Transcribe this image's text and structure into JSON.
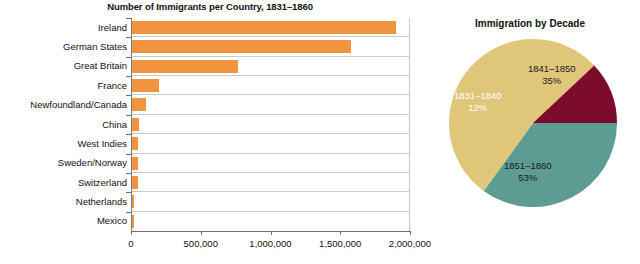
{
  "bar_chart": {
    "title": "Number of Immigrants per Country, 1831–1860",
    "x_ticks": [
      "0",
      "500,000",
      "1,000,000",
      "1,500,000",
      "2,000,000"
    ]
  },
  "pie_chart": {
    "title": "Immigration by Decade"
  },
  "colors": {
    "bar": "#F2943F",
    "pie_teal": "#5C9C92",
    "pie_crimson": "#7D0B2B",
    "pie_gold": "#E0C678",
    "grid": "#C9C9C9",
    "axis": "#6D6D6D",
    "text": "#111111"
  },
  "chart_data": [
    {
      "type": "bar",
      "title": "Number of Immigrants per Country, 1831–1860",
      "xlabel": "",
      "ylabel": "",
      "orientation": "horizontal",
      "grid": true,
      "xlim": [
        0,
        2000000
      ],
      "xticks": [
        0,
        500000,
        1000000,
        1500000,
        2000000
      ],
      "xtick_labels": [
        "0",
        "500,000",
        "1,000,000",
        "1,500,000",
        "2,000,000"
      ],
      "categories": [
        "Ireland",
        "German States",
        "Great Britain",
        "France",
        "Newfoundland/Canada",
        "China",
        "West Indies",
        "Sweden/Norway",
        "Switzerland",
        "Netherlands",
        "Mexico"
      ],
      "values": [
        1890000,
        1570000,
        760000,
        195000,
        100000,
        48000,
        40000,
        42000,
        40000,
        16000,
        6000
      ],
      "series": [
        {
          "name": "Immigrants 1831–1860",
          "values": [
            1890000,
            1570000,
            760000,
            195000,
            100000,
            48000,
            40000,
            42000,
            40000,
            16000,
            6000
          ]
        }
      ]
    },
    {
      "type": "pie",
      "title": "Immigration by Decade",
      "legend": "none",
      "labels": [
        "1841–1850",
        "1851–1860",
        "1831–1840"
      ],
      "values": [
        35,
        53,
        12
      ],
      "value_labels": [
        "35%",
        "53%",
        "12%"
      ],
      "colors": [
        "#5C9C92",
        "#E0C678",
        "#7D0B2B"
      ],
      "slices": [
        {
          "label": "1841–1850",
          "percent": 35,
          "percent_label": "35%",
          "color": "#5C9C92"
        },
        {
          "label": "1851–1860",
          "percent": 53,
          "percent_label": "53%",
          "color": "#E0C678"
        },
        {
          "label": "1831–1840",
          "percent": 12,
          "percent_label": "12%",
          "color": "#7D0B2B"
        }
      ]
    }
  ]
}
